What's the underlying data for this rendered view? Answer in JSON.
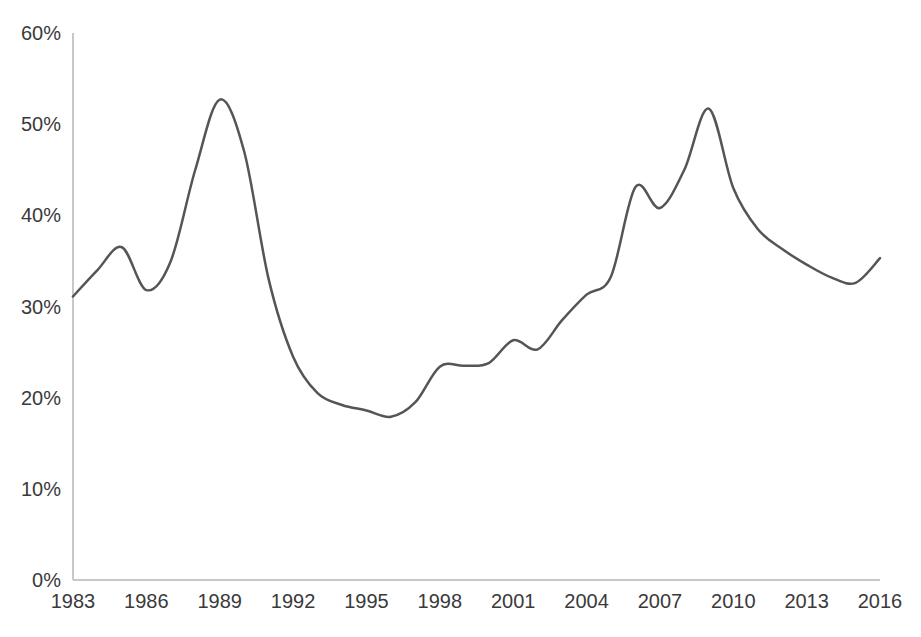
{
  "chart_data": {
    "type": "line",
    "title": "",
    "subtitle": "",
    "xlabel": "",
    "ylabel": "",
    "xlim": [
      1983,
      2016
    ],
    "ylim": [
      0,
      60
    ],
    "grid": false,
    "legend": false,
    "legend_position": "none",
    "y_tick_labels": [
      "0%",
      "10%",
      "20%",
      "30%",
      "40%",
      "50%",
      "60%"
    ],
    "y_tick_values": [
      0,
      10,
      20,
      30,
      40,
      50,
      60
    ],
    "x_tick_labels": [
      "1983",
      "1986",
      "1989",
      "1992",
      "1995",
      "1998",
      "2001",
      "2004",
      "2007",
      "2010",
      "2013",
      "2016"
    ],
    "x_tick_values": [
      1983,
      1986,
      1989,
      1992,
      1995,
      1998,
      2001,
      2004,
      2007,
      2010,
      2013,
      2016
    ],
    "x": [
      1983,
      1984,
      1985,
      1986,
      1987,
      1988,
      1989,
      1990,
      1991,
      1992,
      1993,
      1994,
      1995,
      1996,
      1997,
      1998,
      1999,
      2000,
      2001,
      2002,
      2003,
      2004,
      2005,
      2006,
      2007,
      2008,
      2009,
      2010,
      2011,
      2012,
      2013,
      2014,
      2015,
      2016
    ],
    "values": [
      31.1,
      34.0,
      36.5,
      31.8,
      35.0,
      45.0,
      52.7,
      47.0,
      33.0,
      24.5,
      20.5,
      19.2,
      18.6,
      17.9,
      19.5,
      23.4,
      23.5,
      23.8,
      26.3,
      25.3,
      28.5,
      31.3,
      33.3,
      43.1,
      40.8,
      45.0,
      51.7,
      43.0,
      38.5,
      36.3,
      34.6,
      33.2,
      32.6,
      35.3
    ],
    "series": [
      {
        "name": "series-1",
        "color": "#555555",
        "line_width": 2.5,
        "smooth": true,
        "values": [
          31.1,
          34.0,
          36.5,
          31.8,
          35.0,
          45.0,
          52.7,
          47.0,
          33.0,
          24.5,
          20.5,
          19.2,
          18.6,
          17.9,
          19.5,
          23.4,
          23.5,
          23.8,
          26.3,
          25.3,
          28.5,
          31.3,
          33.3,
          43.1,
          40.8,
          45.0,
          51.7,
          43.0,
          38.5,
          36.3,
          34.6,
          33.2,
          32.6,
          35.3
        ]
      }
    ],
    "annotations": [],
    "notes": {
      "peak_1989": 52.7,
      "peak_2007": 51.7,
      "trough_1996": 17.9,
      "end_value": 34.0
    }
  },
  "style": {
    "background": "#ffffff",
    "axis_color": "#c8c8c8",
    "tick_text_color": "#3a3a3a",
    "series_color": "#555555"
  },
  "geometry": {
    "plot_left": 73,
    "plot_right": 880,
    "plot_top": 33,
    "plot_bottom": 580,
    "width": 921,
    "height": 637
  }
}
